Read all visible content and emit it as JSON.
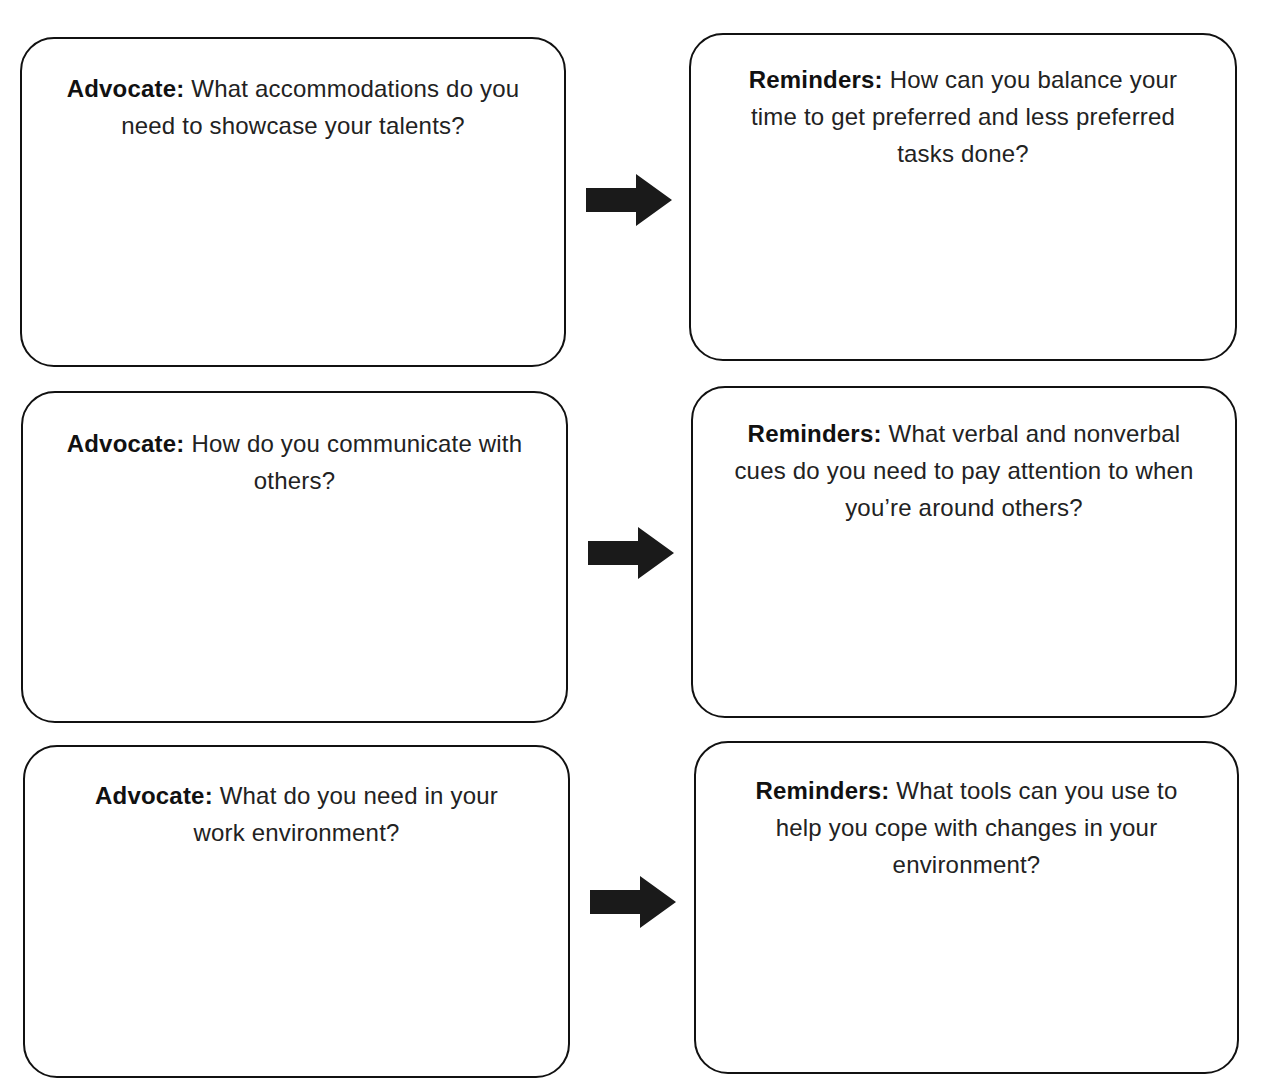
{
  "worksheet": {
    "rows": [
      {
        "advocate": {
          "label": "Advocate:",
          "question": " What accommodations do you need to showcase your talents?"
        },
        "reminders": {
          "label": "Reminders:",
          "question": " How can you balance your time to get preferred and less preferred tasks done?"
        }
      },
      {
        "advocate": {
          "label": "Advocate:",
          "question": " How do you communicate with others?"
        },
        "reminders": {
          "label": "Reminders:",
          "question": " What verbal and nonverbal cues do you need to pay attention to when you’re around others?"
        }
      },
      {
        "advocate": {
          "label": "Advocate:",
          "question": " What do you need in your work environment?"
        },
        "reminders": {
          "label": "Reminders:",
          "question": " What tools can you use to help you cope with changes in your environment?"
        }
      }
    ],
    "icons": {
      "connector": "right-arrow-icon"
    },
    "colors": {
      "border": "#111111",
      "arrow": "#1a1a1a",
      "background": "#ffffff"
    }
  }
}
